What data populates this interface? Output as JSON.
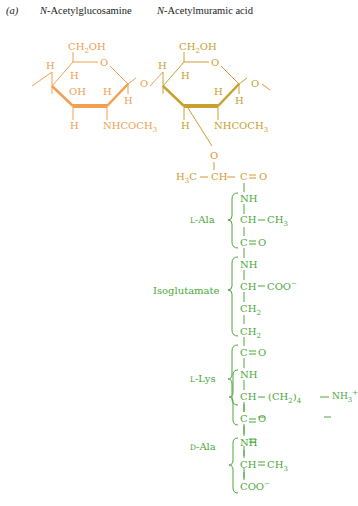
{
  "header": {
    "panel_label": "(a)",
    "sugar1_title": "N-Acetylglucosamine",
    "sugar2_title": "N-Acetylmuramic acid"
  },
  "colors": {
    "glcnac": "#f0a050",
    "murnac": "#c8a030",
    "lactyl": "#d9962e",
    "peptide": "#4aa83a",
    "header_text": "#222222"
  },
  "glcnac": {
    "c6": "CH2OH",
    "ring_o": "O",
    "h_c4": "H",
    "h_c5": "H",
    "oh_c3": "OH",
    "h_c2": "H",
    "h_c1": "H",
    "h_c3_down": "H",
    "nhcoch3": "NHCOCH3",
    "glyco_o": "O"
  },
  "murnac": {
    "c6": "CH2OH",
    "ring_o": "O",
    "h_c4": "H",
    "h_c5": "H",
    "h_c2": "H",
    "h_c1": "H",
    "h_c3_down": "H",
    "nhcoch3": "NHCOCH3",
    "glyco_o": "O"
  },
  "lactyl": {
    "ether_o": "O",
    "h3c": "H3C",
    "ch": "CH",
    "c": "C",
    "o": "O"
  },
  "peptide": [
    {
      "name": "L-Ala",
      "lines": [
        "NH",
        "CH — CH3",
        "C═O"
      ]
    },
    {
      "name": "Isoglutamate",
      "lines": [
        "NH",
        "CH — COO−",
        "CH2",
        "CH2",
        "C═O"
      ]
    },
    {
      "name": "L-Lys",
      "lines": [
        "NH",
        "CH — (CH2)4 — NH3+",
        "C═O"
      ]
    },
    {
      "name": "D-Ala",
      "lines": [
        "NH",
        "CH — CH3",
        "COO−"
      ]
    }
  ]
}
